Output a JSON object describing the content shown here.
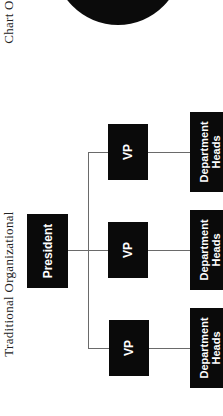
{
  "header": {
    "top_title_fragment": "Chart O",
    "title": "Traditional Organizational"
  },
  "org_chart": {
    "root": {
      "label": "President"
    },
    "vps": [
      {
        "label": "VP",
        "child": {
          "label": "Department\nHeads"
        }
      },
      {
        "label": "VP",
        "child": {
          "label": "Department\nHeads"
        }
      },
      {
        "label": "VP",
        "child": {
          "label": "Department\nHeads"
        }
      }
    ]
  },
  "colors": {
    "box_fill": "#0a0a0a",
    "box_text": "#ffffff",
    "connector": "#6a6a6a",
    "background": "#ffffff"
  }
}
